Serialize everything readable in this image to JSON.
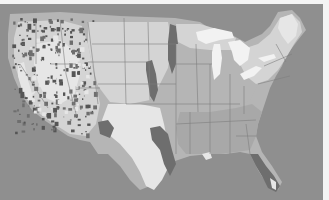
{
  "map": {
    "title": "",
    "subject": "contiguous-united-states",
    "style": "grayscale-raster",
    "palette": {
      "ocean": "#8f8f8f",
      "land_base": "#b5b5b5",
      "land_light": "#d4d4d4",
      "land_lighter": "#e6e6e6",
      "land_dark": "#6e6e6e",
      "land_darker": "#555555",
      "lake": "#f2f2f2",
      "state_border": "#7d7d7d",
      "frame": "#f4f4f4"
    },
    "legend": [],
    "labels": []
  }
}
